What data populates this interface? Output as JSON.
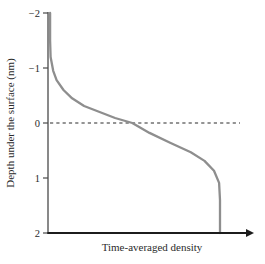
{
  "chart_data": {
    "type": "line",
    "title": "",
    "xlabel": "Time-averaged density",
    "ylabel": "Depth under the surface (nm)",
    "x_axis": {
      "tick_labels": [],
      "units": "arbitrary (unlabeled)",
      "arrow_end": true
    },
    "y_axis": {
      "ticks": [
        -2,
        -1,
        0,
        1,
        2
      ],
      "tick_labels": [
        "−2",
        "−1",
        "0",
        "1",
        "2"
      ],
      "lim": [
        -2,
        2
      ],
      "orientation": "depth increases downward"
    },
    "reference_line": {
      "depth": 0,
      "style": "dashed",
      "color": "#2b2b2b"
    },
    "series": [
      {
        "name": "time-averaged-density-profile",
        "color": "#8e8e8e",
        "points_density_depth": [
          [
            0.012,
            -2.0
          ],
          [
            0.012,
            -1.5
          ],
          [
            0.015,
            -1.2
          ],
          [
            0.03,
            -0.95
          ],
          [
            0.05,
            -0.78
          ],
          [
            0.09,
            -0.6
          ],
          [
            0.14,
            -0.45
          ],
          [
            0.21,
            -0.31
          ],
          [
            0.3,
            -0.2
          ],
          [
            0.39,
            -0.09
          ],
          [
            0.49,
            0.0
          ],
          [
            0.59,
            0.18
          ],
          [
            0.71,
            0.36
          ],
          [
            0.83,
            0.53
          ],
          [
            0.91,
            0.69
          ],
          [
            0.965,
            0.87
          ],
          [
            0.995,
            1.09
          ],
          [
            1.0,
            1.4
          ],
          [
            1.0,
            2.0
          ]
        ],
        "bulk_density_normalized": 1.0,
        "density_at_surface_normalized": 0.49
      }
    ]
  },
  "colors": {
    "background": "#ffffff",
    "y_axis": "#4a4a4a",
    "x_axis": "#1c1c1c",
    "text": "#2b2b2b",
    "dashed_line": "#2b2b2b",
    "curve": "#8e8e8e"
  }
}
